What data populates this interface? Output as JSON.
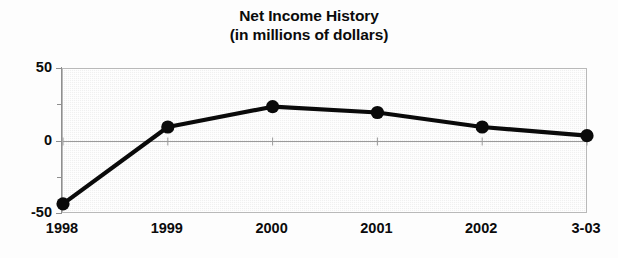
{
  "title": {
    "line1": "Net Income History",
    "line2": "(in millions of dollars)"
  },
  "colors": {
    "line": "#0a0a0a",
    "marker": "#0a0a0a",
    "plot_background": "#efefef",
    "plot_border": "#b9b9b9",
    "axis": "#8f8f8f",
    "zero_line": "#9a9a9a",
    "text": "#0b0b0b",
    "page_background": "#fdfdfd"
  },
  "axes": {
    "y_labels": [
      "50",
      "0",
      "-50"
    ],
    "y_label_values": [
      50,
      0,
      -50
    ],
    "y_minor_tick_values": [
      25,
      -25
    ],
    "x_labels": [
      "1998",
      "1999",
      "2000",
      "2001",
      "2002",
      "3-03"
    ]
  },
  "chart_data": {
    "type": "line",
    "title": "Net Income History (in millions of dollars)",
    "xlabel": "",
    "ylabel": "",
    "ylim": [
      -50,
      50
    ],
    "yticks": [
      -50,
      -25,
      0,
      25,
      50
    ],
    "ytick_labels": [
      "-50",
      "",
      "0",
      "",
      "50"
    ],
    "grid": false,
    "legend": "none",
    "categories": [
      "1998",
      "1999",
      "2000",
      "2001",
      "2002",
      "3-03"
    ],
    "values": [
      -43,
      10,
      24,
      20,
      10,
      4
    ],
    "series": [
      {
        "name": "Net Income",
        "values": [
          -43,
          10,
          24,
          20,
          10,
          4
        ]
      }
    ],
    "marker": "filled-circle",
    "units": "millions of dollars"
  }
}
